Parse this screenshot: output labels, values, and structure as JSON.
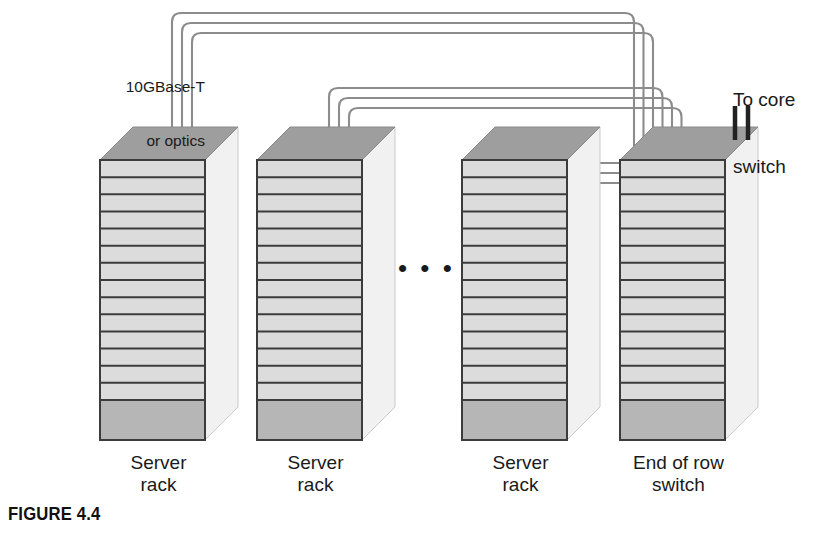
{
  "figure": {
    "caption": "FIGURE 4.4"
  },
  "labels": {
    "cable_type_line1": "10GBase-T",
    "cable_type_line2": "or optics",
    "core_uplink_line1": "To core",
    "core_uplink_line2": "switch",
    "ellipsis": "• • •"
  },
  "racks": [
    {
      "id": "rack-1",
      "label_line1": "Server",
      "label_line2": "rack",
      "x": 100,
      "type": "server"
    },
    {
      "id": "rack-2",
      "label_line1": "Server",
      "label_line2": "rack",
      "x": 257,
      "type": "server"
    },
    {
      "id": "rack-3",
      "label_line1": "Server",
      "label_line2": "rack",
      "x": 462,
      "type": "server"
    },
    {
      "id": "rack-4",
      "label_line1": "End of row",
      "label_line2": "switch",
      "x": 620,
      "type": "switch"
    }
  ],
  "rack_geometry": {
    "width": 105,
    "body_top": 160,
    "body_bottom": 440,
    "depth_x": 33,
    "depth_y": 33,
    "shelf_count": 14,
    "base_block_top": 400
  },
  "cables": {
    "per_rack": 3,
    "route_tops": [
      13,
      23,
      33
    ],
    "group_tops": [
      13,
      88,
      163
    ],
    "uplink_count": 2
  },
  "colors": {
    "shelf_fill": "#dcdcdc",
    "shelf_stroke": "#3c3c3c",
    "top_face": "#9e9e9e",
    "side_face": "#f1f1f1",
    "base_block": "#b6b6b6",
    "cable": "#8c8c8c",
    "uplink": "#222222",
    "text": "#1a1a1a"
  }
}
